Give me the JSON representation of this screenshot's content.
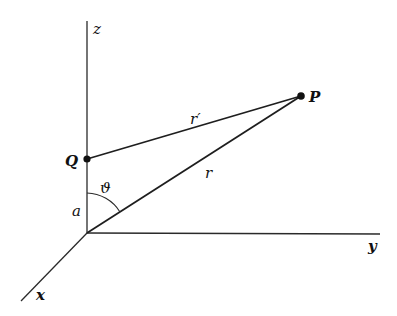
{
  "diagram": {
    "type": "3D coordinate geometry",
    "axes": {
      "z": {
        "label": "z"
      },
      "y": {
        "label": "y"
      },
      "x": {
        "label": "x"
      }
    },
    "points": {
      "P": {
        "label": "P"
      },
      "Q": {
        "label": "Q"
      }
    },
    "segments": {
      "r": {
        "label": "r",
        "from": "origin",
        "to": "P"
      },
      "r_prime": {
        "label": "r′",
        "from": "Q",
        "to": "P"
      },
      "a": {
        "label": "a",
        "from": "origin",
        "to": "Q"
      }
    },
    "angle": {
      "label": "ϑ",
      "between": [
        "z-axis",
        "r"
      ]
    }
  }
}
